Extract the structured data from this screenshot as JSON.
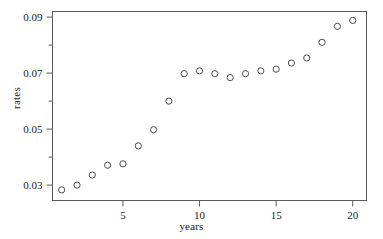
{
  "chart_data": {
    "type": "scatter",
    "title": "",
    "xlabel": "years",
    "ylabel": "rates",
    "x": [
      1,
      2,
      3,
      4,
      5,
      6,
      7,
      8,
      9,
      10,
      11,
      12,
      13,
      14,
      15,
      16,
      17,
      18,
      19,
      20
    ],
    "values": [
      0.0283,
      0.03,
      0.0336,
      0.0371,
      0.0376,
      0.044,
      0.0498,
      0.06,
      0.0698,
      0.0708,
      0.0698,
      0.0684,
      0.0698,
      0.0708,
      0.0714,
      0.0736,
      0.0754,
      0.081,
      0.0867,
      0.0888
    ],
    "xlim": [
      0.4,
      20.9
    ],
    "ylim": [
      0.0245,
      0.092
    ],
    "xticks": [
      5,
      10,
      15,
      20
    ],
    "xtick_labels": [
      "5",
      "10",
      "15",
      "20"
    ],
    "yticks": [
      0.03,
      0.05,
      0.07,
      0.09
    ],
    "ytick_labels": [
      "0.03",
      "0.05",
      "0.07",
      "0.09"
    ],
    "yticks_minor": [
      0.04,
      0.06,
      0.08
    ],
    "grid": false,
    "legend": null,
    "marker": "open-circle",
    "marker_color": "#4a4a55",
    "frame_color": "#5a5a5a"
  },
  "axes": {
    "x_title": "years",
    "y_title": "rates"
  }
}
